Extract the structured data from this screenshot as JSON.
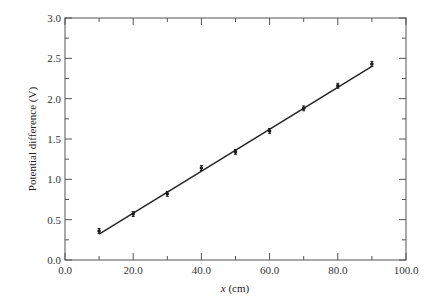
{
  "chart_data": {
    "type": "scatter",
    "title": "",
    "xlabel": "x (cm)",
    "xlabel_var": "x",
    "xlabel_unit": " (cm)",
    "ylabel": "Potential difference (V)",
    "xlim": [
      0,
      100
    ],
    "ylim": [
      0,
      3.0
    ],
    "xticks": [
      0,
      20,
      40,
      60,
      80,
      100
    ],
    "xtick_labels": [
      "0.0",
      "20.0",
      "40.0",
      "60.0",
      "80.0",
      "100.0"
    ],
    "xminor_ticks": [
      10,
      30,
      50,
      70,
      90
    ],
    "yticks": [
      0,
      0.5,
      1.0,
      1.5,
      2.0,
      2.5,
      3.0
    ],
    "ytick_labels": [
      "0.0",
      "0.5",
      "1.0",
      "1.5",
      "2.0",
      "2.5",
      "3.0"
    ],
    "yminor_ticks": [
      0.25,
      0.75,
      1.25,
      1.75,
      2.25,
      2.75
    ],
    "grid": false,
    "legend": null,
    "series": [
      {
        "name": "measured",
        "style": "points-with-error-bars",
        "x": [
          10,
          20,
          30,
          40,
          50,
          60,
          70,
          80,
          90
        ],
        "y": [
          0.36,
          0.57,
          0.82,
          1.14,
          1.34,
          1.6,
          1.88,
          2.16,
          2.43
        ],
        "yerr": 0.03
      },
      {
        "name": "best-fit line",
        "style": "line",
        "x": [
          10,
          90
        ],
        "y": [
          0.32,
          2.4
        ]
      }
    ]
  },
  "colors": {
    "axis": "#555555",
    "data": "#1a1a1a",
    "line": "#222222"
  }
}
